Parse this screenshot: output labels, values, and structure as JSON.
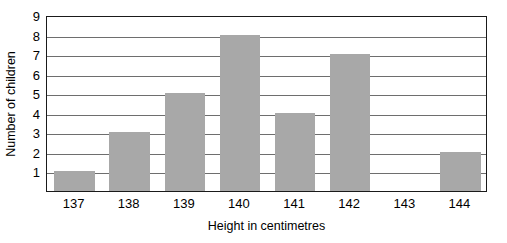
{
  "chart_data": {
    "type": "bar",
    "title": "",
    "xlabel": "Height in centimetres",
    "ylabel": "Number of children",
    "categories": [
      "137",
      "138",
      "139",
      "140",
      "141",
      "142",
      "143",
      "144"
    ],
    "values": [
      1,
      3,
      5,
      8,
      4,
      7,
      0,
      2
    ],
    "series": [
      {
        "name": "Number of children",
        "values": [
          1,
          3,
          5,
          8,
          4,
          7,
          0,
          2
        ]
      }
    ],
    "ylim": [
      0,
      9
    ],
    "ytick_labels": [
      "9",
      "8",
      "7",
      "6",
      "5",
      "4",
      "3",
      "2",
      "1"
    ],
    "ytick_values": [
      9,
      8,
      7,
      6,
      5,
      4,
      3,
      2,
      1
    ],
    "grid": true,
    "grid_orientation": "horizontal",
    "legend": "none",
    "bar_color": "#a8a8a8",
    "axis_color": "#1a1a1a",
    "gridline_color": "#6e6e6e",
    "background": "#ffffff"
  }
}
